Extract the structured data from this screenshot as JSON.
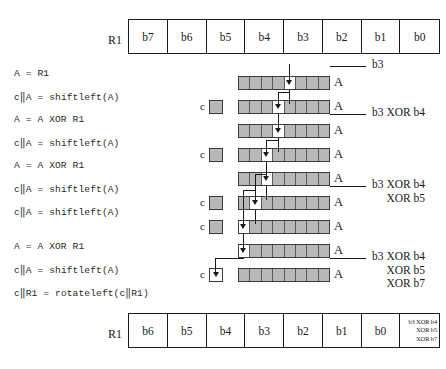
{
  "diagram": {
    "artifact_text": "",
    "registers": {
      "top": {
        "label": "R1",
        "cells": [
          "b7",
          "b6",
          "b5",
          "b4",
          "b3",
          "b2",
          "b1",
          "b0"
        ]
      },
      "bottom": {
        "label": "R1",
        "cells": [
          "b6",
          "b5",
          "b4",
          "b3",
          "b2",
          "b1",
          "b0"
        ],
        "last_cell_lines": [
          "b3 XOR b4",
          "XOR b5",
          "XOR b7"
        ]
      }
    },
    "instructions": [
      "A = R1",
      "c‖A = shiftleft(A)",
      "A = A XOR R1",
      "c‖A = shiftleft(A)",
      "A = A XOR R1",
      "c‖A = shiftleft(A)",
      "c‖A = shiftleft(A)",
      "A = A XOR R1",
      "c‖A = shiftleft(A)",
      "c‖R1 = rotateleft(c‖R1)"
    ],
    "accumulator_rows": [
      {
        "label": "A",
        "highlight_index": 4
      },
      {
        "label": "A",
        "highlight_index": 3
      },
      {
        "label": "A",
        "highlight_index": 3
      },
      {
        "label": "A",
        "highlight_index": 2
      },
      {
        "label": "A",
        "highlight_index": 2
      },
      {
        "label": "A",
        "highlight_index": 1
      },
      {
        "label": "A",
        "highlight_index": 0
      },
      {
        "label": "A",
        "highlight_index": 0
      },
      {
        "label": "A",
        "highlight_index": -1
      }
    ],
    "carry_boxes": [
      {
        "label": "c",
        "filled": true
      },
      {
        "label": "c",
        "filled": true
      },
      {
        "label": "c",
        "filled": true
      },
      {
        "label": "c",
        "filled": true
      },
      {
        "label": "c",
        "filled": false
      }
    ],
    "annotations": [
      {
        "lines": [
          "b3"
        ]
      },
      {
        "lines": [
          "b3 XOR b4"
        ]
      },
      {
        "lines": [
          "b3 XOR b4",
          "XOR b5"
        ]
      },
      {
        "lines": [
          "b3 XOR b4",
          "XOR b5",
          "XOR b7"
        ]
      }
    ],
    "colors": {
      "ink": "#1a1a1a",
      "register_fill": "#ffffff",
      "accumulator_fill": "#b8b8b8",
      "highlight_fill": "#ffffff",
      "cell_border": "#5a5a5a"
    }
  }
}
